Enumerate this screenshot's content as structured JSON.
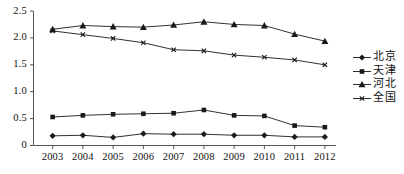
{
  "chart_data": {
    "type": "line",
    "title": "",
    "xlabel": "",
    "ylabel": "",
    "categories": [
      "2003",
      "2004",
      "2005",
      "2006",
      "2007",
      "2008",
      "2009",
      "2010",
      "2011",
      "2012"
    ],
    "ylim": [
      0,
      2.5
    ],
    "yticks": [
      "0",
      "0.5",
      "1.0",
      "1.5",
      "2.0",
      "2.5"
    ],
    "ytick_values": [
      0,
      0.5,
      1.0,
      1.5,
      2.0,
      2.5
    ],
    "grid": false,
    "legend_position": "right",
    "series": [
      {
        "name": "北京",
        "marker": "diamond",
        "values": [
          0.18,
          0.19,
          0.15,
          0.22,
          0.21,
          0.21,
          0.19,
          0.19,
          0.16,
          0.16
        ]
      },
      {
        "name": "天津",
        "marker": "square",
        "values": [
          0.53,
          0.56,
          0.58,
          0.59,
          0.6,
          0.66,
          0.56,
          0.55,
          0.37,
          0.34
        ]
      },
      {
        "name": "河北",
        "marker": "triangle",
        "values": [
          2.16,
          2.23,
          2.21,
          2.2,
          2.24,
          2.3,
          2.25,
          2.23,
          2.07,
          1.94
        ]
      },
      {
        "name": "全国",
        "marker": "cross",
        "values": [
          2.13,
          2.06,
          1.99,
          1.91,
          1.78,
          1.76,
          1.68,
          1.64,
          1.59,
          1.5
        ]
      }
    ]
  },
  "legend": {
    "items": [
      {
        "label": "北京",
        "marker": "diamond"
      },
      {
        "label": "天津",
        "marker": "square"
      },
      {
        "label": "河北",
        "marker": "triangle"
      },
      {
        "label": "全国",
        "marker": "cross"
      }
    ]
  },
  "colors": {
    "line": "#1a1a1a",
    "axis": "#555555",
    "text": "#111111",
    "background": "#ffffff"
  }
}
